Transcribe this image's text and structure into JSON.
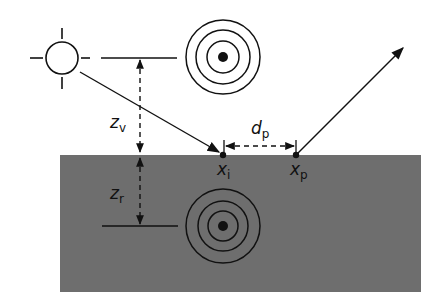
{
  "diagram": {
    "type": "dipole-source-geometry",
    "colors": {
      "medium": "#6e6e6e",
      "line": "#111111",
      "background": "#ffffff"
    },
    "labels": {
      "z_v": {
        "main": "z",
        "sub": "v"
      },
      "z_r": {
        "main": "z",
        "sub": "r"
      },
      "d_p": {
        "main": "d",
        "sub": "p"
      },
      "x_i": {
        "main": "x",
        "sub": "i"
      },
      "x_p": {
        "main": "x",
        "sub": "p"
      }
    },
    "elements": {
      "light_source": "sun-icon",
      "virtual_source": "concentric-circles-icon",
      "real_source": "concentric-circles-icon",
      "incident_ray": "arrow",
      "exit_ray": "arrow",
      "medium": "gray-rectangle"
    }
  }
}
